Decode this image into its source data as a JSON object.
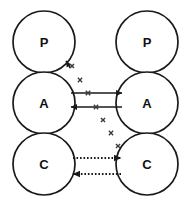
{
  "figure": {
    "width": 191,
    "height": 201,
    "background_color": "#ffffff",
    "stroke_color": "#1a1a1a",
    "cross_color": "#3a3a3a"
  },
  "columns": [
    {
      "id": "left",
      "name": "left-column",
      "center_x": 44,
      "nodes": [
        {
          "label": "P",
          "name": "node-left-p",
          "cx": 44,
          "cy": 42,
          "r": 31
        },
        {
          "label": "A",
          "name": "node-left-a",
          "cx": 44,
          "cy": 103,
          "r": 31
        },
        {
          "label": "C",
          "name": "node-left-c",
          "cx": 44,
          "cy": 164,
          "r": 31
        }
      ]
    },
    {
      "id": "right",
      "name": "right-column",
      "center_x": 147,
      "nodes": [
        {
          "label": "P",
          "name": "node-right-p",
          "cx": 147,
          "cy": 42,
          "r": 31
        },
        {
          "label": "A",
          "name": "node-right-a",
          "cx": 147,
          "cy": 103,
          "r": 31
        },
        {
          "label": "C",
          "name": "node-right-c",
          "cx": 147,
          "cy": 164,
          "r": 31
        }
      ]
    }
  ],
  "connections": [
    {
      "name": "arrow-a-left-to-right",
      "style": "solid",
      "direction": "right",
      "x1": 71,
      "y1": 93,
      "x2": 122,
      "y2": 93,
      "blocked": true
    },
    {
      "name": "arrow-a-right-to-left",
      "style": "solid",
      "direction": "left",
      "x1": 122,
      "y1": 107,
      "x2": 71,
      "y2": 107,
      "blocked": true
    },
    {
      "name": "arrow-c-left-to-right",
      "style": "dotted",
      "direction": "right",
      "x1": 73,
      "y1": 158,
      "x2": 121,
      "y2": 158,
      "blocked": false
    },
    {
      "name": "arrow-c-right-to-left",
      "style": "dotted",
      "direction": "left",
      "x1": 121,
      "y1": 174,
      "x2": 73,
      "y2": 174,
      "blocked": false
    },
    {
      "name": "arrow-diagonal-to-p",
      "style": "crossed",
      "direction": "upleft",
      "x1": 120,
      "y1": 150,
      "x2": 66,
      "y2": 61,
      "blocked": true
    }
  ],
  "cross_marks": [
    {
      "name": "cross-mark-1",
      "cx": 72,
      "cy": 66,
      "size": 4.0
    },
    {
      "name": "cross-mark-2",
      "cx": 80,
      "cy": 80,
      "size": 4.3
    },
    {
      "name": "cross-mark-3",
      "cx": 88,
      "cy": 93,
      "size": 4.5
    },
    {
      "name": "cross-mark-4",
      "cx": 96,
      "cy": 107,
      "size": 4.3
    },
    {
      "name": "cross-mark-5",
      "cx": 103,
      "cy": 120,
      "size": 4.2
    },
    {
      "name": "cross-mark-6",
      "cx": 111,
      "cy": 133,
      "size": 4.3
    },
    {
      "name": "cross-mark-7",
      "cx": 118,
      "cy": 146,
      "size": 4.2
    }
  ]
}
